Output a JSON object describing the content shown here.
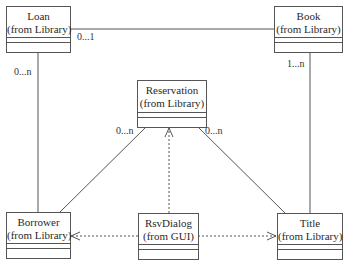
{
  "diagram": {
    "type": "uml-class-diagram",
    "classes": [
      {
        "id": "loan",
        "name": "Loan",
        "package": "(from Library)"
      },
      {
        "id": "book",
        "name": "Book",
        "package": "(from Library)"
      },
      {
        "id": "reservation",
        "name": "Reservation",
        "package": "(from Library)"
      },
      {
        "id": "borrower",
        "name": "Borrower",
        "package": "(from Library)"
      },
      {
        "id": "rsvdialog",
        "name": "RsvDialog",
        "package": "(from GUI)"
      },
      {
        "id": "title",
        "name": "Title",
        "package": "(from Library)"
      }
    ],
    "associations": [
      {
        "from": "Loan",
        "to": "Book",
        "kind": "association",
        "multiplicity": "0...1"
      },
      {
        "from": "Loan",
        "to": "Borrower",
        "kind": "association",
        "multiplicity": "0...n"
      },
      {
        "from": "Book",
        "to": "Title",
        "kind": "association",
        "multiplicity": "1...n"
      },
      {
        "from": "Reservation",
        "to": "Borrower",
        "kind": "association",
        "multiplicity": "0...n"
      },
      {
        "from": "Reservation",
        "to": "Title",
        "kind": "association",
        "multiplicity": "0...n"
      },
      {
        "from": "RsvDialog",
        "to": "Reservation",
        "kind": "dependency"
      },
      {
        "from": "RsvDialog",
        "to": "Borrower",
        "kind": "dependency"
      },
      {
        "from": "RsvDialog",
        "to": "Title",
        "kind": "dependency"
      }
    ],
    "labels": {
      "loan_book": "0...1",
      "loan_borrower": "0...n",
      "book_title": "1...n",
      "reservation_borrower": "0...n",
      "reservation_title": "0...n"
    },
    "colors": {
      "line": "#555555",
      "text": "#2a2a2a",
      "background": "#ffffff"
    }
  }
}
